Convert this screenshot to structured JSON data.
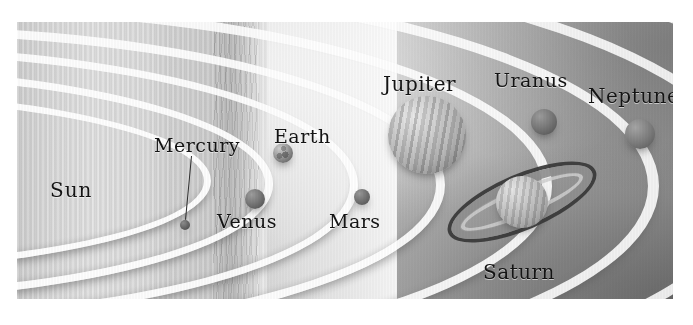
{
  "figure": {
    "style": "grayscale illustration",
    "canvas": {
      "width": 693,
      "height": 325
    },
    "plate": {
      "x": 17,
      "y": 22,
      "width": 656,
      "height": 277
    }
  },
  "colors": {
    "ink": "#141414",
    "orbit": "#ffffff",
    "backdrop_light": "#d8d8d8",
    "backdrop_dark": "#8a8a8a",
    "sun_band": "#dcdcdc",
    "ring_outer": "#3b3b3b"
  },
  "sun": {
    "label": "Sun",
    "label_x": 33,
    "label_y": 156,
    "band_left": 0,
    "band_width": 250
  },
  "orbits": [
    {
      "name": "mercury-orbit",
      "left": -620,
      "top": 68,
      "width": 800,
      "height": 168,
      "border": 7
    },
    {
      "name": "venus-orbit",
      "left": -640,
      "top": 45,
      "width": 880,
      "height": 218,
      "border": 8
    },
    {
      "name": "earth-orbit",
      "left": -660,
      "top": 24,
      "width": 985,
      "height": 262,
      "border": 8
    },
    {
      "name": "mars-orbit",
      "left": -680,
      "top": 4,
      "width": 1090,
      "height": 300,
      "border": 9
    },
    {
      "name": "jupiter-orbit",
      "left": -700,
      "top": -20,
      "width": 1215,
      "height": 348,
      "border": 10
    },
    {
      "name": "saturn-orbit",
      "left": -720,
      "top": -46,
      "width": 1340,
      "height": 398,
      "border": 11
    },
    {
      "name": "uranus-orbit",
      "left": -740,
      "top": -74,
      "width": 1460,
      "height": 450,
      "border": 11
    },
    {
      "name": "neptune-orbit",
      "left": -760,
      "top": -104,
      "width": 1580,
      "height": 505,
      "border": 12
    }
  ],
  "planets": [
    {
      "name": "Mercury",
      "label": "Mercury",
      "cx": 168,
      "cy": 203,
      "r": 5,
      "label_x": 137,
      "label_y": 112,
      "leader": {
        "x1": 175,
        "y1": 134,
        "x2": 169,
        "y2": 198
      }
    },
    {
      "name": "Venus",
      "label": "Venus",
      "cx": 238,
      "cy": 177,
      "r": 10,
      "label_x": 200,
      "label_y": 188
    },
    {
      "name": "Earth",
      "label": "Earth",
      "cx": 266,
      "cy": 131,
      "r": 10,
      "label_x": 257,
      "label_y": 103
    },
    {
      "name": "Mars",
      "label": "Mars",
      "cx": 345,
      "cy": 175,
      "r": 8,
      "label_x": 312,
      "label_y": 188
    },
    {
      "name": "Jupiter",
      "label": "Jupiter",
      "cx": 410,
      "cy": 113,
      "r": 39,
      "label_x": 366,
      "label_y": 50
    },
    {
      "name": "Saturn",
      "label": "Saturn",
      "cx": 505,
      "cy": 180,
      "r": 26,
      "label_x": 466,
      "label_y": 238,
      "ring": {
        "rx": 80,
        "ry": 28,
        "tilt_deg": -23
      }
    },
    {
      "name": "Uranus",
      "label": "Uranus",
      "cx": 527,
      "cy": 100,
      "r": 13,
      "label_x": 477,
      "label_y": 47
    },
    {
      "name": "Neptune",
      "label": "Neptune",
      "cx": 623,
      "cy": 112,
      "r": 15,
      "label_x": 571,
      "label_y": 62
    }
  ]
}
